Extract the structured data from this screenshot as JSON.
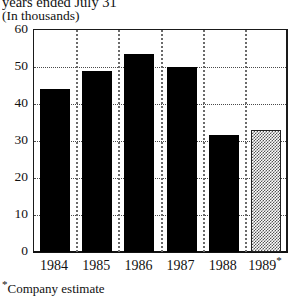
{
  "header": {
    "title_clipped": "years ended July 31",
    "subtitle": "(In thousands)"
  },
  "footnote": {
    "marker": "*",
    "text": "Company estimate"
  },
  "chart_data": {
    "type": "bar",
    "title": "years ended July 31",
    "subtitle": "(In thousands)",
    "xlabel": "",
    "ylabel": "",
    "ylim": [
      0,
      60
    ],
    "yticks": [
      0,
      10,
      20,
      30,
      40,
      50,
      60
    ],
    "grid": true,
    "legend": "none",
    "categories": [
      "1984",
      "1985",
      "1986",
      "1987",
      "1988",
      "1989"
    ],
    "category_labels": [
      "1984",
      "1985",
      "1986",
      "1987",
      "1988",
      "1989*"
    ],
    "values": [
      44,
      49,
      53.5,
      50,
      31.5,
      33
    ],
    "bar_styles": [
      "solid",
      "solid",
      "solid",
      "solid",
      "solid",
      "hatched"
    ],
    "annotations": [
      "* Company estimate — 1989 bar is a company estimate"
    ]
  },
  "colors": {
    "bar": "#000000",
    "estimate_bar": "#888888",
    "frame": "#1a1a1a",
    "grid": "#4a4a4a",
    "background": "#ffffff"
  }
}
